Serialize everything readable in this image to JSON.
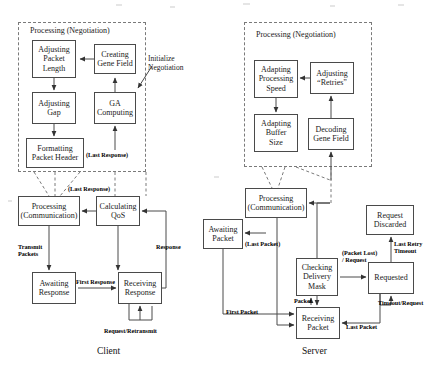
{
  "figure": {
    "background_color": "#ffffff",
    "line_color": "#4a4a4a",
    "dashed_color": "#7a7a7a"
  },
  "captions": {
    "client": "Client",
    "server": "Server"
  },
  "client": {
    "negotiation_group": {
      "label": "Processing (Negotiation)",
      "x": 18,
      "y": 22,
      "width": 128,
      "height": 150
    },
    "nodes": [
      {
        "id": "adjusting-packet-length",
        "label": "Adjusting\nPacket\nLength",
        "x": 32,
        "y": 40,
        "width": 44,
        "height": 38
      },
      {
        "id": "creating-gene-field",
        "label": "Creating\nGene Field",
        "x": 94,
        "y": 44,
        "width": 42,
        "height": 30
      },
      {
        "id": "adjusting-gap",
        "label": "Adjusting\nGap",
        "x": 32,
        "y": 92,
        "width": 44,
        "height": 32
      },
      {
        "id": "ga-computing",
        "label": "GA\nComputing",
        "x": 94,
        "y": 92,
        "width": 42,
        "height": 32
      },
      {
        "id": "formatting-packet-header",
        "label": "Formatting\nPacket Header",
        "x": 26,
        "y": 138,
        "width": 58,
        "height": 30
      },
      {
        "id": "processing-communication",
        "label": "Processing\n(Communication)",
        "x": 18,
        "y": 196,
        "width": 62,
        "height": 30
      },
      {
        "id": "calculating-qos",
        "label": "Calculating\nQoS",
        "x": 96,
        "y": 196,
        "width": 44,
        "height": 30
      },
      {
        "id": "awaiting-response",
        "label": "Awaiting\nResponse",
        "x": 32,
        "y": 272,
        "width": 44,
        "height": 32
      },
      {
        "id": "receiving-response",
        "label": "Receiving\nResponse",
        "x": 118,
        "y": 272,
        "width": 44,
        "height": 32
      }
    ],
    "edge_labels": [
      {
        "id": "initialize-negotiation",
        "text": "Initialize\nNegotiation",
        "x": 148,
        "y": 55,
        "bold": false
      },
      {
        "id": "last-response-negotiation",
        "text": "(Last Response)",
        "x": 86,
        "y": 151,
        "bold": true
      },
      {
        "id": "last-response-qos",
        "text": "(Last Response)",
        "x": 68,
        "y": 185,
        "bold": true
      },
      {
        "id": "transmit-packets",
        "text": "Transmit\nPackets",
        "x": 18,
        "y": 243,
        "bold": true
      },
      {
        "id": "response",
        "text": "Response",
        "x": 156,
        "y": 243,
        "bold": true
      },
      {
        "id": "first-response",
        "text": "First Response",
        "x": 76,
        "y": 278,
        "bold": true
      },
      {
        "id": "request-retransmit",
        "text": "Request/Retransmit",
        "x": 104,
        "y": 327,
        "bold": true
      }
    ]
  },
  "server": {
    "negotiation_group": {
      "label": "Processing (Negotiation)",
      "x": 244,
      "y": 22,
      "width": 128,
      "height": 145
    },
    "nodes": [
      {
        "id": "adapting-processing-speed",
        "label": "Adapting\nProcessing\nSpeed",
        "x": 254,
        "y": 60,
        "width": 44,
        "height": 38
      },
      {
        "id": "adjusting-retries",
        "label": "Adjusting\n“Retries”",
        "x": 310,
        "y": 62,
        "width": 44,
        "height": 32
      },
      {
        "id": "adapting-buffer-size",
        "label": "Adapting\nBuffer\nSize",
        "x": 254,
        "y": 114,
        "width": 44,
        "height": 38
      },
      {
        "id": "decoding-gene-field",
        "label": "Decoding\nGene Field",
        "x": 308,
        "y": 118,
        "width": 46,
        "height": 32
      },
      {
        "id": "processing-communication-server",
        "label": "Processing\n(Communication)",
        "x": 245,
        "y": 188,
        "width": 62,
        "height": 30
      },
      {
        "id": "awaiting-packet",
        "label": "Awaiting\nPacket",
        "x": 203,
        "y": 219,
        "width": 40,
        "height": 30
      },
      {
        "id": "checking-delivery-mask",
        "label": "Checking\nDelivery\nMask",
        "x": 296,
        "y": 258,
        "width": 42,
        "height": 38
      },
      {
        "id": "requested",
        "label": "Requested",
        "x": 368,
        "y": 262,
        "width": 46,
        "height": 32
      },
      {
        "id": "request-discarded",
        "label": "Request\nDiscarded",
        "x": 366,
        "y": 205,
        "width": 48,
        "height": 30
      },
      {
        "id": "receiving-packet",
        "label": "Receiving\nPacket",
        "x": 296,
        "y": 307,
        "width": 44,
        "height": 32
      }
    ],
    "edge_labels": [
      {
        "id": "last-packet-awaiting",
        "text": "(Last Packet)",
        "x": 245,
        "y": 240,
        "bold": true
      },
      {
        "id": "packet-lost-request",
        "text": "(Packet Lost)\n/ Request",
        "x": 342,
        "y": 249,
        "bold": true
      },
      {
        "id": "last-retry-timeout",
        "text": "Last Retry\nTimeout",
        "x": 394,
        "y": 240,
        "bold": true
      },
      {
        "id": "packet",
        "text": "Packet",
        "x": 294,
        "y": 297,
        "bold": true
      },
      {
        "id": "timeout-request",
        "text": "Timeout/Request",
        "x": 378,
        "y": 299,
        "bold": true
      },
      {
        "id": "first-packet",
        "text": "First Packet",
        "x": 226,
        "y": 308,
        "bold": true
      },
      {
        "id": "last-packet-receiving",
        "text": "Last Packet",
        "x": 346,
        "y": 323,
        "bold": true
      }
    ]
  }
}
